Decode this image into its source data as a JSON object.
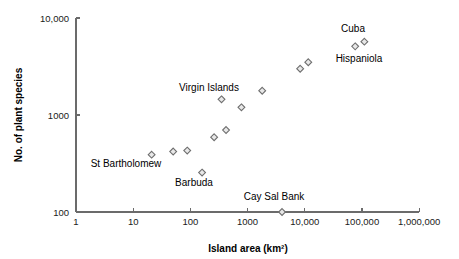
{
  "chart_data": {
    "type": "scatter",
    "title": "",
    "xlabel": "Island area (km²)",
    "ylabel": "No. of plant species",
    "xscale": "log",
    "yscale": "log",
    "xlim": [
      1,
      1000000
    ],
    "ylim": [
      100,
      10000
    ],
    "grid": false,
    "legend": false,
    "xticks": [
      1,
      10,
      100,
      1000,
      10000,
      100000,
      1000000
    ],
    "xticklabels": [
      "1",
      "10",
      "100",
      "1000",
      "10,000",
      "100,000",
      "1,000,000"
    ],
    "yticks": [
      100,
      1000,
      10000
    ],
    "yticklabels": [
      "100",
      "1000",
      "10,000"
    ],
    "marker": "open-diamond",
    "points": [
      {
        "x": 21,
        "y": 390,
        "label": ""
      },
      {
        "x": 50,
        "y": 420,
        "label": ""
      },
      {
        "x": 88,
        "y": 430,
        "label": ""
      },
      {
        "x": 160,
        "y": 255,
        "label": "Barbuda"
      },
      {
        "x": 260,
        "y": 590,
        "label": ""
      },
      {
        "x": 420,
        "y": 700,
        "label": ""
      },
      {
        "x": 350,
        "y": 1450,
        "label": "Virgin Islands"
      },
      {
        "x": 780,
        "y": 1200,
        "label": ""
      },
      {
        "x": 1800,
        "y": 1780,
        "label": ""
      },
      {
        "x": 4000,
        "y": 100,
        "label": "Cay Sal Bank"
      },
      {
        "x": 8300,
        "y": 3000,
        "label": ""
      },
      {
        "x": 11500,
        "y": 3500,
        "label": ""
      },
      {
        "x": 76000,
        "y": 5100,
        "label": "Hispaniola"
      },
      {
        "x": 110000,
        "y": 5700,
        "label": "Cuba"
      }
    ],
    "annotations": [
      {
        "text": "Cuba",
        "x_px": 353,
        "y_px": 32
      },
      {
        "text": "Hispaniola",
        "x_px": 359,
        "y_px": 62
      },
      {
        "text": "Virgin Islands",
        "x_px": 209,
        "y_px": 91
      },
      {
        "text": "St Bartholomew",
        "x_px": 126,
        "y_px": 167
      },
      {
        "text": "Barbuda",
        "x_px": 194,
        "y_px": 186
      },
      {
        "text": "Cay Sal Bank",
        "x_px": 274,
        "y_px": 200
      }
    ]
  },
  "geometry": {
    "origin_x": 76,
    "origin_y": 212,
    "decade_px_x": 57.2,
    "decade_px_y": 97,
    "marker_radius": 3.4
  }
}
